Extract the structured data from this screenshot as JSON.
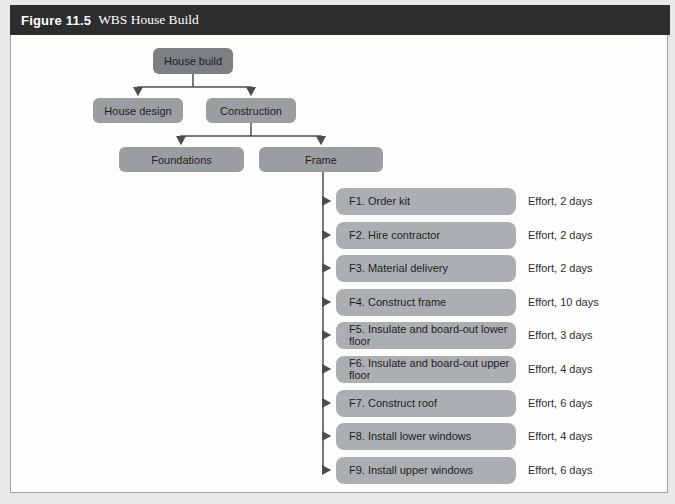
{
  "figure": {
    "label": "Figure 11.5",
    "title": "WBS House Build",
    "header_bg": "#2c2d2f",
    "header_text_color": "#ffffff",
    "border_color": "#a2a2a0",
    "body_bg": "#fdfdfc"
  },
  "diagram": {
    "type": "wbs-tree",
    "colors": {
      "level1_box": "#7d8082",
      "level2_box": "#9b9ea0",
      "task_box": "#acafb1",
      "connector": "#4b4e50",
      "box_text": "#1d1e1f"
    },
    "nodes": {
      "root": "House build",
      "design": "House design",
      "construction": "Construction",
      "foundations": "Foundations",
      "frame": "Frame"
    },
    "hierarchy_note": "House build > (House design, Construction); Construction > (Foundations, Frame); Frame > F1-F9 tasks",
    "tasks": [
      {
        "label": "F1. Order kit",
        "effort": "Effort, 2 days"
      },
      {
        "label": "F2. Hire contractor",
        "effort": "Effort, 2 days"
      },
      {
        "label": "F3. Material delivery",
        "effort": "Effort, 2 days"
      },
      {
        "label": "F4. Construct frame",
        "effort": "Effort, 10 days"
      },
      {
        "label": "F5. Insulate and board-out lower floor",
        "effort": "Effort, 3 days"
      },
      {
        "label": "F6. Insulate and board-out upper floor",
        "effort": "Effort, 4 days"
      },
      {
        "label": "F7. Construct roof",
        "effort": "Effort, 6 days"
      },
      {
        "label": "F8. Install lower windows",
        "effort": "Effort, 4 days"
      },
      {
        "label": "F9. Install upper windows",
        "effort": "Effort, 6 days"
      }
    ]
  }
}
